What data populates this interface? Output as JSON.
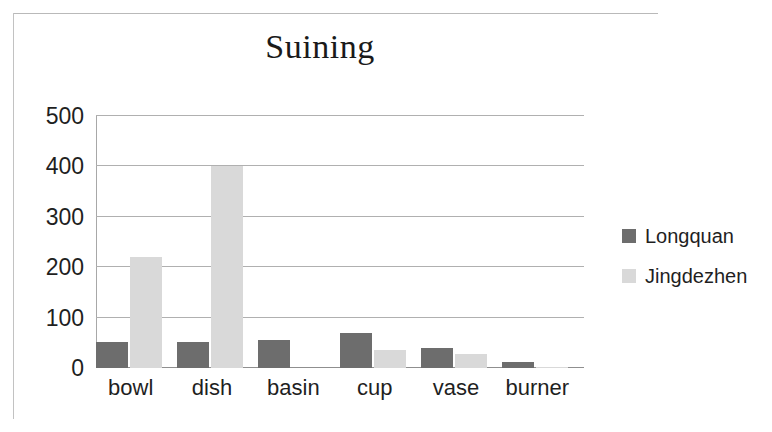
{
  "chart_data": {
    "type": "bar",
    "title": "Suining",
    "xlabel": "",
    "ylabel": "",
    "categories": [
      "bowl",
      "dish",
      "basin",
      "cup",
      "vase",
      "burner"
    ],
    "series": [
      {
        "name": "Longquan",
        "color": "#6d6d6d",
        "values": [
          52,
          52,
          56,
          70,
          40,
          12
        ]
      },
      {
        "name": "Jingdezhen",
        "color": "#d9d9d9",
        "values": [
          220,
          400,
          0,
          35,
          28,
          3
        ]
      }
    ],
    "ylim": [
      0,
      500
    ],
    "yticks": [
      500,
      400,
      300,
      200,
      100,
      0
    ],
    "ytick_labels": [
      "500",
      "400",
      "300",
      "200",
      "100",
      "0"
    ],
    "grid": true,
    "legend_position": "right",
    "legend_entries": [
      "Longquan",
      "Jingdezhen"
    ]
  },
  "colors": {
    "series_longquan": "#6d6d6d",
    "series_jingdezhen": "#d9d9d9",
    "gridline": "#b0b0b0",
    "axis": "#8f8f8f",
    "text": "#1f1f1f",
    "background": "#ffffff"
  }
}
